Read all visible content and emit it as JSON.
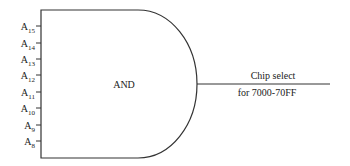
{
  "gate": {
    "type": "AND",
    "label": "AND"
  },
  "inputs": [
    {
      "base": "A",
      "sub": "15"
    },
    {
      "base": "A",
      "sub": "14"
    },
    {
      "base": "A",
      "sub": "13"
    },
    {
      "base": "A",
      "sub": "12"
    },
    {
      "base": "A",
      "sub": "11"
    },
    {
      "base": "A",
      "sub": "10"
    },
    {
      "base": "A",
      "sub": "9"
    },
    {
      "base": "A",
      "sub": "8"
    }
  ],
  "output": {
    "line1": "Chip select",
    "line2": "for 7000-70FF"
  },
  "colors": {
    "stroke": "#333333",
    "text": "#222222",
    "background": "#ffffff"
  }
}
